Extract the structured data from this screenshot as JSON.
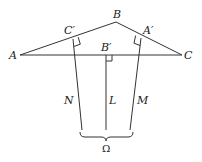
{
  "diagram": {
    "type": "geometry",
    "colors": {
      "stroke": "#333333",
      "text": "#222222",
      "background": "#ffffff"
    },
    "points": {
      "A": {
        "label": "A",
        "x": 20,
        "y": 55
      },
      "B": {
        "label": "B",
        "x": 116,
        "y": 22
      },
      "C": {
        "label": "C",
        "x": 182,
        "y": 55
      },
      "C_prime": {
        "label": "C′",
        "x": 73,
        "y": 39
      },
      "A_prime": {
        "label": "A′",
        "x": 141,
        "y": 38
      },
      "B_prime": {
        "label": "B′",
        "x": 106,
        "y": 55
      }
    },
    "lines": {
      "N": {
        "label": "N"
      },
      "L": {
        "label": "L"
      },
      "M": {
        "label": "M"
      }
    },
    "brace": {
      "label": "Ω"
    }
  }
}
